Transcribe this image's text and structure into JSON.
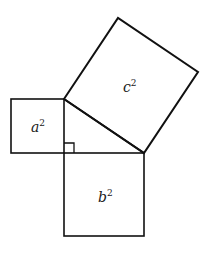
{
  "diagram": {
    "stroke_color": "#111111",
    "background": "#ffffff",
    "squares": [
      {
        "id": "a",
        "label": "a",
        "exponent": "2"
      },
      {
        "id": "b",
        "label": "b",
        "exponent": "2"
      },
      {
        "id": "c",
        "label": "c",
        "exponent": "2"
      }
    ],
    "right_angle_marker": true
  }
}
